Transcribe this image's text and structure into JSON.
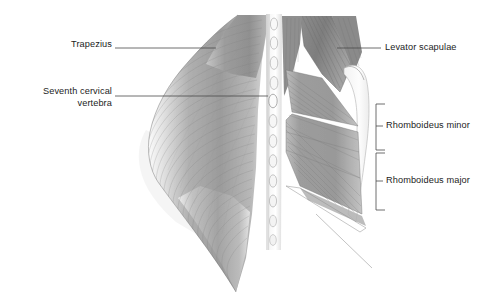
{
  "figure": {
    "view": "posterior",
    "background_color": "#ffffff",
    "ink_color": "#1c1c1c",
    "leader_color": "#4a4a4a"
  },
  "labels": [
    {
      "id": "trapezius",
      "text": "Trapezius",
      "side": "left",
      "text_x": 110,
      "text_y": 44,
      "leader": {
        "x1": 115,
        "y1": 48,
        "x2": 216,
        "y2": 48
      }
    },
    {
      "id": "seventh-cervical-vertebra",
      "text": "Seventh cervical\nvertebra",
      "side": "left",
      "text_x": 110,
      "text_y": 89,
      "leader": {
        "x1": 115,
        "y1": 96,
        "x2": 268,
        "y2": 96
      }
    },
    {
      "id": "levator-scapulae",
      "text": "Levator scapulae",
      "side": "right",
      "text_x": 385,
      "text_y": 43,
      "leader": {
        "x1": 337,
        "y1": 48,
        "x2": 381,
        "y2": 48
      }
    },
    {
      "id": "rhomboideus-minor",
      "text": "Rhomboideus minor",
      "side": "right-bracket",
      "text_x": 385,
      "text_y": 120,
      "bracket": {
        "x": 376,
        "y_top": 104,
        "y_bottom": 150,
        "tick_y": 126,
        "tick_len": 7,
        "arm": 9
      }
    },
    {
      "id": "rhomboideus-major",
      "text": "Rhomboideus major",
      "side": "right-bracket",
      "text_x": 385,
      "text_y": 175,
      "bracket": {
        "x": 376,
        "y_top": 153,
        "y_bottom": 210,
        "tick_y": 181,
        "tick_len": 7,
        "arm": 9
      }
    }
  ],
  "anatomy": {
    "structures": [
      {
        "name": "trapezius",
        "tone": "#9a9a9a",
        "description": "large flat sheet covering left upper back, fine curved striations"
      },
      {
        "name": "vertebral-column",
        "tone": "#efefef",
        "description": "midline column of oval spinous processes"
      },
      {
        "name": "levator-scapulae",
        "tone": "#8b8b8b",
        "description": "diagonal strap from upper cervical to scapula superior angle"
      },
      {
        "name": "rhomboideus-minor",
        "tone": "#a0a0a0",
        "description": "upper narrow band running infero-laterally"
      },
      {
        "name": "rhomboideus-major",
        "tone": "#a5a5a5",
        "description": "lower broad band running infero-laterally"
      },
      {
        "name": "scapula-border",
        "tone": "#f6f6f6",
        "description": "pale medial border of scapula at right"
      }
    ]
  }
}
